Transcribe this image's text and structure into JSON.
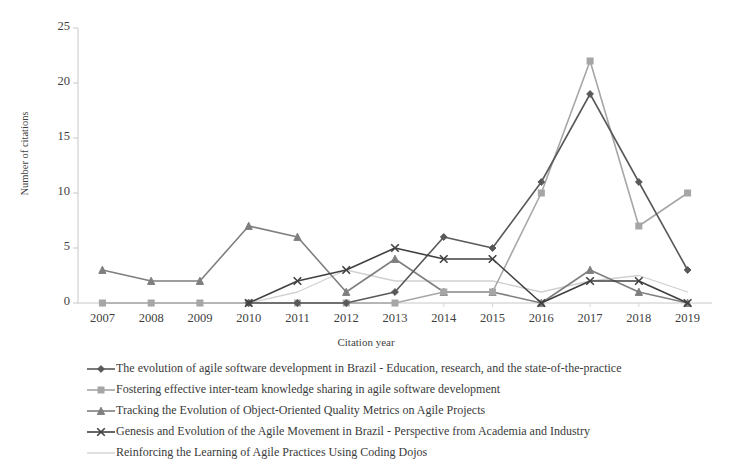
{
  "chart_data": {
    "type": "line",
    "title": "",
    "xlabel": "Citation year",
    "ylabel": "Number of citations",
    "categories": [
      "2007",
      "2008",
      "2009",
      "2010",
      "2011",
      "2012",
      "2013",
      "2014",
      "2015",
      "2016",
      "2017",
      "2018",
      "2019"
    ],
    "ylim": [
      0,
      25
    ],
    "yticks": [
      0,
      5,
      10,
      15,
      20,
      25
    ],
    "grid": false,
    "legend_position": "bottom",
    "series": [
      {
        "name": "The evolution of agile software development in Brazil - Education, research, and the state-of-the-practice",
        "marker": "diamond",
        "color": "#595959",
        "values": [
          null,
          null,
          null,
          0,
          0,
          0,
          1,
          6,
          5,
          11,
          19,
          11,
          3
        ]
      },
      {
        "name": "Fostering effective inter-team knowledge sharing in agile software development",
        "marker": "square",
        "color": "#a6a6a6",
        "values": [
          0,
          0,
          0,
          0,
          0,
          0,
          0,
          1,
          1,
          10,
          22,
          7,
          10
        ]
      },
      {
        "name": "Tracking the Evolution of Object-Oriented Quality Metrics on Agile Projects",
        "marker": "triangle",
        "color": "#7f7f7f",
        "values": [
          3,
          2,
          2,
          7,
          6,
          1,
          4,
          1,
          1,
          0,
          3,
          1,
          0
        ]
      },
      {
        "name": "Genesis and Evolution of the Agile Movement in Brazil - Perspective from Academia and Industry",
        "marker": "x",
        "color": "#404040",
        "values": [
          null,
          null,
          null,
          0,
          2,
          3,
          5,
          4,
          4,
          0,
          2,
          2,
          0
        ]
      },
      {
        "name": "Reinforcing the Learning of Agile Practices Using Coding Dojos",
        "marker": "none",
        "color": "#d0d0d0",
        "values": [
          null,
          null,
          null,
          0,
          1,
          3,
          2,
          2,
          2,
          1,
          2,
          2.5,
          1
        ]
      }
    ]
  },
  "axis": {
    "y_ticks": [
      "0",
      "5",
      "10",
      "15",
      "20",
      "25"
    ],
    "x_ticks": [
      "2007",
      "2008",
      "2009",
      "2010",
      "2011",
      "2012",
      "2013",
      "2014",
      "2015",
      "2016",
      "2017",
      "2018",
      "2019"
    ],
    "x_title": "Citation year",
    "y_title": "Number of citations"
  },
  "legend": {
    "items": [
      {
        "label": "The evolution of agile software development in Brazil - Education, research, and the state-of-the-practice",
        "marker": "diamond-marker",
        "color": "#595959"
      },
      {
        "label": "Fostering effective inter-team knowledge sharing in agile software development",
        "marker": "square-marker",
        "color": "#a6a6a6"
      },
      {
        "label": "Tracking the Evolution of Object-Oriented Quality Metrics on Agile Projects",
        "marker": "triangle-marker",
        "color": "#7f7f7f"
      },
      {
        "label": "Genesis and Evolution of the Agile Movement in Brazil - Perspective from Academia and Industry",
        "marker": "x-marker",
        "color": "#404040"
      },
      {
        "label": "Reinforcing the Learning of Agile Practices Using Coding Dojos",
        "marker": "line-marker",
        "color": "#d0d0d0"
      }
    ]
  }
}
